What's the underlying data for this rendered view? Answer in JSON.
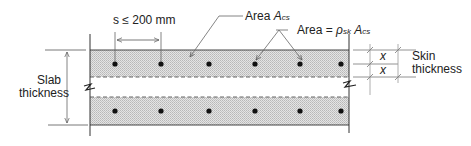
{
  "diagram": {
    "type": "cross-section",
    "colors": {
      "line": "#333333",
      "thin_line": "#777777",
      "hatch_fill": "#d8d8d8",
      "dot": "#111111",
      "background": "#ffffff"
    },
    "labels": {
      "spacing": "s ≤ 200 mm",
      "area_acs_prefix": "Area ",
      "area_acs_symbol": "A",
      "area_acs_sub": "cs",
      "area_rho_prefix": "Area = ",
      "area_rho_symbol": "ρ",
      "area_rho_sub": "sk",
      "area_rho_symbol2": "A",
      "area_rho_sub2": "cs",
      "slab_line1": "Slab",
      "slab_line2": "thickness",
      "skin_line1": "Skin",
      "skin_line2": "thickness",
      "x_top": "x",
      "x_bottom": "x"
    },
    "bars": {
      "top_row_x": [
        115,
        161,
        209,
        255,
        300,
        341
      ],
      "bottom_row_x": [
        115,
        161,
        209,
        255,
        300,
        341
      ]
    }
  }
}
